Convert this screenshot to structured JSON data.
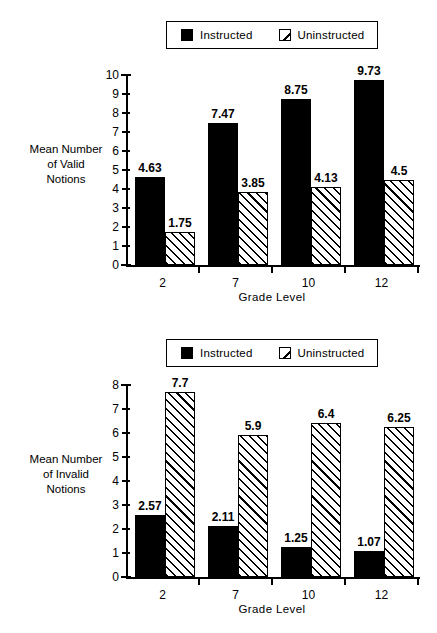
{
  "figure": {
    "legend": {
      "items": [
        {
          "label": "Instructed",
          "swatch": "solid-square-icon"
        },
        {
          "label": "Uninstructed",
          "swatch": "diagonal-hatch-square-icon"
        }
      ]
    }
  },
  "panels": [
    {
      "id": "valid",
      "y_axis_title_lines": [
        "Mean Number",
        "of  Valid",
        "Notions"
      ],
      "x_axis_title": "Grade Level",
      "y_ticks": [
        "0",
        "1",
        "2",
        "3",
        "4",
        "5",
        "6",
        "7",
        "8",
        "9",
        "10"
      ],
      "x_ticks": [
        "2",
        "7",
        "10",
        "12"
      ],
      "values": {
        "instructed": [
          "4.63",
          "7.47",
          "8.75",
          "9.73"
        ],
        "uninstructed": [
          "1.75",
          "3.85",
          "4.13",
          "4.5"
        ]
      }
    },
    {
      "id": "invalid",
      "y_axis_title_lines": [
        "Mean Number",
        "of  Invalid",
        "Notions"
      ],
      "x_axis_title": "Grade Level",
      "y_ticks": [
        "0",
        "1",
        "2",
        "3",
        "4",
        "5",
        "6",
        "7",
        "8"
      ],
      "x_ticks": [
        "2",
        "7",
        "10",
        "12"
      ],
      "values": {
        "instructed": [
          "2.57",
          "2.11",
          "1.25",
          "1.07"
        ],
        "uninstructed": [
          "7.7",
          "5.9",
          "6.4",
          "6.25"
        ]
      }
    }
  ],
  "chart_data": [
    {
      "type": "bar",
      "title": "",
      "xlabel": "Grade Level",
      "ylabel": "Mean Number of Valid Notions",
      "categories": [
        "2",
        "7",
        "10",
        "12"
      ],
      "series": [
        {
          "name": "Instructed",
          "values": [
            4.63,
            7.47,
            8.75,
            9.73
          ]
        },
        {
          "name": "Uninstructed",
          "values": [
            1.75,
            3.85,
            4.13,
            4.5
          ]
        }
      ],
      "ylim": [
        0,
        10
      ],
      "ytick_step": 1,
      "grid": false,
      "legend_position": "top-center",
      "data_labels": true
    },
    {
      "type": "bar",
      "title": "",
      "xlabel": "Grade Level",
      "ylabel": "Mean Number of Invalid Notions",
      "categories": [
        "2",
        "7",
        "10",
        "12"
      ],
      "series": [
        {
          "name": "Instructed",
          "values": [
            2.57,
            2.11,
            1.25,
            1.07
          ]
        },
        {
          "name": "Uninstructed",
          "values": [
            7.7,
            5.9,
            6.4,
            6.25
          ]
        }
      ],
      "ylim": [
        0,
        8
      ],
      "ytick_step": 1,
      "grid": false,
      "legend_position": "top-center",
      "data_labels": true
    }
  ]
}
